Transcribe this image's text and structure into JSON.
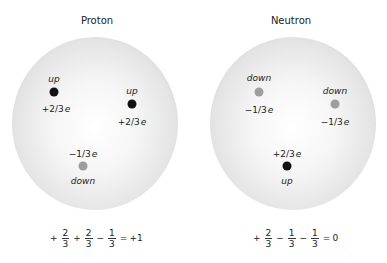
{
  "colors": {
    "up_quark": "#111111",
    "down_quark": "#9e9e9e",
    "sphere_edge": "#b4b4b4",
    "sphere_center": "#ffffff"
  },
  "panels": [
    {
      "title": "Proton",
      "quarks": [
        {
          "flavor": "up",
          "charge": "+2/3",
          "unit": "e",
          "x": 54,
          "y": 92,
          "flavor_y": 79,
          "charge_y": 109,
          "type": "up"
        },
        {
          "flavor": "up",
          "charge": "+2/3",
          "unit": "e",
          "x": 132,
          "y": 104,
          "flavor_y": 91,
          "charge_y": 122,
          "type": "up"
        },
        {
          "flavor": "down",
          "charge": "−1/3",
          "unit": "e",
          "x": 83,
          "y": 166,
          "flavor_y": 181,
          "charge_y": 154,
          "type": "down"
        }
      ],
      "equation": {
        "terms": [
          {
            "sign": "+",
            "num": "2",
            "den": "3"
          },
          {
            "sign": "+",
            "num": "2",
            "den": "3"
          },
          {
            "sign": "−",
            "num": "1",
            "den": "3"
          }
        ],
        "equals": "=",
        "result": "+1"
      }
    },
    {
      "title": "Neutron",
      "quarks": [
        {
          "flavor": "down",
          "charge": "−1/3",
          "unit": "e",
          "x": 65,
          "y": 92,
          "flavor_y": 78,
          "charge_y": 110,
          "type": "down"
        },
        {
          "flavor": "down",
          "charge": "−1/3",
          "unit": "e",
          "x": 141,
          "y": 104,
          "flavor_y": 91,
          "charge_y": 122,
          "type": "down"
        },
        {
          "flavor": "up",
          "charge": "+2/3",
          "unit": "e",
          "x": 93,
          "y": 166,
          "flavor_y": 181,
          "charge_y": 154,
          "type": "up"
        }
      ],
      "equation": {
        "terms": [
          {
            "sign": "+",
            "num": "2",
            "den": "3"
          },
          {
            "sign": "−",
            "num": "1",
            "den": "3"
          },
          {
            "sign": "−",
            "num": "1",
            "den": "3"
          }
        ],
        "equals": "=",
        "result": "0"
      }
    }
  ]
}
